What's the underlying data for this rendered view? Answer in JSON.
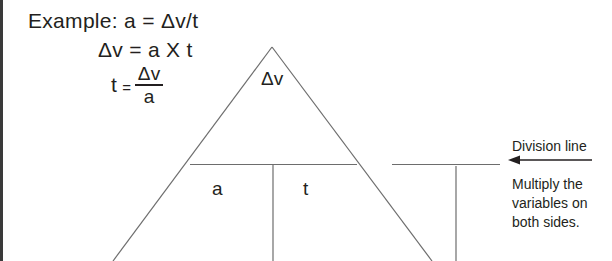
{
  "document": {
    "title": "Equation triangle: a = Δv/t",
    "ink_color": "#231f20",
    "line_color": "#6d6d6d",
    "background": "#ffffff"
  },
  "equations": {
    "line1": "Example: a = Δv/t",
    "line2": "Δv = a X t",
    "line3_lhs": "t",
    "line3_equals": "=",
    "line3_numerator": "Δv",
    "line3_denominator": "a"
  },
  "triangle": {
    "top_label": "Δv",
    "bottom_left_label": "a",
    "bottom_right_label": "t",
    "apex": {
      "x": 272,
      "y": 47
    },
    "divider_left": {
      "x": 190,
      "y": 164
    },
    "divider_right": {
      "x": 357,
      "y": 164
    },
    "vertical_divider_x": 273
  },
  "second_triangle": {
    "divider_left": {
      "x": 392,
      "y": 164
    },
    "divider_right": {
      "x": 500,
      "y": 164
    },
    "vertical_divider_x": 456
  },
  "annotations": {
    "division_line_label": "Division line",
    "arrow": {
      "name": "left-arrow",
      "direction": "left",
      "from_x": 592,
      "to_x": 510,
      "y": 160
    },
    "multiply_note": {
      "line1": "Multiply the",
      "line2": "variables on",
      "line3": "both sides."
    }
  }
}
